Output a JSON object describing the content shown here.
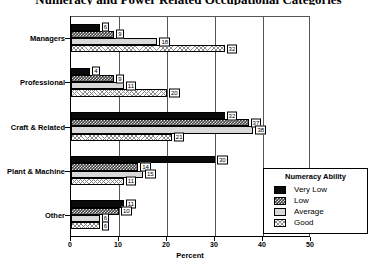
{
  "chart_data": {
    "type": "bar",
    "orientation": "horizontal",
    "title": "Numeracy and Power Related Occupational Categories",
    "xlabel": "Percent",
    "ylabel": "",
    "xlim": [
      0,
      50
    ],
    "xticks": [
      0,
      10,
      20,
      30,
      40,
      50
    ],
    "grid": true,
    "legend_title": "Numeracy Ability",
    "legend_position": "lower-right-inside",
    "categories": [
      "Managers",
      "Professional",
      "Craft & Related",
      "Plant & Machine",
      "Other"
    ],
    "series": [
      {
        "name": "Very Low",
        "values": [
          6,
          4,
          32,
          30,
          11
        ]
      },
      {
        "name": "Low",
        "values": [
          9,
          9,
          37,
          14,
          10
        ]
      },
      {
        "name": "Average",
        "values": [
          18,
          11,
          38,
          15,
          6
        ]
      },
      {
        "name": "Good",
        "values": [
          32,
          20,
          21,
          11,
          6
        ]
      }
    ]
  },
  "legend": {
    "title": "Numeracy Ability",
    "items": [
      {
        "label": "Very Low",
        "pattern": "solid-black"
      },
      {
        "label": "Low",
        "pattern": "checker-dark"
      },
      {
        "label": "Average",
        "pattern": "solid-lightgray"
      },
      {
        "label": "Good",
        "pattern": "crosshatch-light"
      }
    ]
  },
  "axis": {
    "x_title": "Percent",
    "x_tick_labels": [
      "0",
      "10",
      "20",
      "30",
      "40",
      "50"
    ]
  }
}
